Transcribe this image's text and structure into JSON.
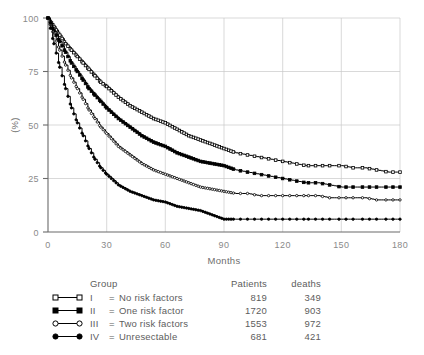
{
  "chart_data": {
    "type": "line",
    "title": "",
    "xlabel": "Months",
    "ylabel": "(%)",
    "xlim": [
      0,
      180
    ],
    "ylim": [
      0,
      100
    ],
    "xticks": [
      0,
      30,
      60,
      90,
      120,
      150,
      180
    ],
    "yticks": [
      0,
      25,
      50,
      75,
      100
    ],
    "xtick_labels": [
      "0",
      "30",
      "60",
      "90",
      "120",
      "150",
      "180"
    ],
    "ytick_labels": [
      "0",
      "25",
      "50",
      "75",
      "100"
    ],
    "grid": true,
    "legend_position": "below",
    "x": [
      0,
      3,
      6,
      9,
      12,
      15,
      18,
      21,
      24,
      27,
      30,
      36,
      42,
      48,
      54,
      60,
      66,
      72,
      78,
      84,
      90,
      96,
      102,
      108,
      114,
      120,
      126,
      132,
      138,
      144,
      150,
      156,
      162,
      168,
      174,
      180
    ],
    "series": [
      {
        "name": "I = No risk factors",
        "group": "I",
        "marker": "open-square",
        "values": [
          100,
          96,
          92,
          88,
          85,
          82,
          79,
          76,
          73,
          70,
          68,
          63,
          59,
          56,
          53,
          51,
          48,
          45,
          43,
          41,
          39,
          37,
          36,
          35,
          34,
          33,
          32,
          31,
          31,
          31,
          31,
          30,
          30,
          29,
          28,
          28
        ]
      },
      {
        "name": "II = One risk factor",
        "group": "II",
        "marker": "filled-square",
        "values": [
          100,
          94,
          89,
          84,
          79,
          75,
          71,
          67,
          64,
          61,
          58,
          53,
          49,
          45,
          42,
          40,
          37,
          35,
          33,
          32,
          31,
          29,
          28,
          27,
          26,
          25,
          24,
          23,
          23,
          22,
          21,
          21,
          21,
          21,
          21,
          21
        ]
      },
      {
        "name": "III = Two risk factors",
        "group": "III",
        "marker": "open-circle",
        "values": [
          100,
          92,
          85,
          78,
          72,
          67,
          62,
          57,
          53,
          49,
          46,
          40,
          36,
          32,
          29,
          27,
          25,
          23,
          21,
          20,
          19,
          18,
          18,
          17,
          17,
          17,
          17,
          17,
          17,
          16,
          16,
          16,
          16,
          15,
          15,
          15
        ]
      },
      {
        "name": "IV = Unresectable",
        "group": "IV",
        "marker": "filled-circle",
        "values": [
          100,
          88,
          77,
          67,
          58,
          51,
          45,
          39,
          34,
          30,
          27,
          22,
          19,
          17,
          15,
          14,
          12,
          11,
          10,
          8,
          6,
          6,
          6,
          6,
          6,
          6,
          6,
          6,
          6,
          6,
          6,
          6,
          6,
          6,
          6,
          6
        ]
      }
    ]
  },
  "axes": {
    "y_label": "(%)",
    "x_label": "Months"
  },
  "legend": {
    "headers": {
      "symbol": "",
      "group": "Group",
      "patients": "Patients",
      "deaths": "deaths"
    },
    "rows": [
      {
        "marker": "open-square",
        "roman": "I",
        "equals": "=",
        "name": "No risk factors",
        "patients": "819",
        "deaths": "349"
      },
      {
        "marker": "filled-square",
        "roman": "II",
        "equals": "=",
        "name": "One risk factor",
        "patients": "1720",
        "deaths": "903"
      },
      {
        "marker": "open-circle",
        "roman": "III",
        "equals": "=",
        "name": "Two risk factors",
        "patients": "1553",
        "deaths": "972"
      },
      {
        "marker": "filled-circle",
        "roman": "IV",
        "equals": "=",
        "name": "Unresectable",
        "patients": "681",
        "deaths": "421"
      }
    ]
  },
  "colors": {
    "curve": "#000000",
    "grid": "#c9c9c9",
    "axis": "#6b6b6b",
    "text": "#5d5d5d",
    "tick_text": "#8a8a8a",
    "background": "#ffffff"
  }
}
